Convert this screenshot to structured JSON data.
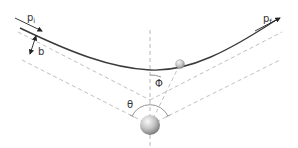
{
  "diagram": {
    "labels": {
      "incoming_momentum": "p",
      "incoming_momentum_sub": "i",
      "outgoing_momentum": "p",
      "outgoing_momentum_sub": "f",
      "impact_parameter": "b",
      "scattering_angle": "θ",
      "position_angle": "Φ"
    },
    "colors": {
      "trajectory": "#333333",
      "dashed": "#b0b0b0",
      "arrow": "#222222",
      "text": "#333333",
      "nucleus_light": "#f2f2f2",
      "nucleus_dark": "#7a7a7a"
    },
    "elements": {
      "nucleus": "large-sphere",
      "particle": "small-sphere",
      "trajectory": "hyperbolic-curve",
      "axis": "vertical-symmetry-axis"
    }
  }
}
